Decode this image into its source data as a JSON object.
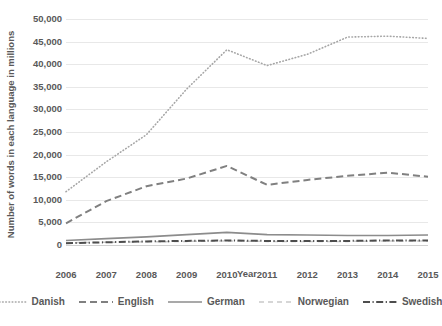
{
  "chart_data": {
    "type": "line",
    "title": "",
    "xlabel": "Year",
    "ylabel": "Number of words in each language in millions",
    "x": [
      2006,
      2007,
      2008,
      2009,
      2010,
      2011,
      2012,
      2013,
      2014,
      2015
    ],
    "xticklabels": [
      "2006",
      "2007",
      "2008",
      "2009",
      "2010",
      "2011",
      "2012",
      "2013",
      "2014",
      "2015"
    ],
    "yticklabels": [
      "0",
      "5,000",
      "10,000",
      "15,000",
      "20,000",
      "25,000",
      "30,000",
      "35,000",
      "40,000",
      "45,000",
      "50,000"
    ],
    "ytickvalues": [
      0,
      5000,
      10000,
      15000,
      20000,
      25000,
      30000,
      35000,
      40000,
      45000,
      50000
    ],
    "ylim": [
      0,
      50000
    ],
    "grid": true,
    "legend_position": "bottom",
    "series": [
      {
        "name": "Danish",
        "style": "dotted",
        "color": "#a6a6a6",
        "values": [
          11800,
          18400,
          24400,
          34500,
          43200,
          39700,
          42200,
          46000,
          46200,
          45700
        ]
      },
      {
        "name": "English",
        "style": "dashed",
        "color": "#808080",
        "values": [
          4800,
          9700,
          13000,
          14700,
          17500,
          13300,
          14400,
          15300,
          16000,
          15100
        ]
      },
      {
        "name": "German",
        "style": "solid",
        "color": "#8c8c8c",
        "values": [
          1000,
          1400,
          1800,
          2300,
          2800,
          2300,
          2200,
          2100,
          2100,
          2200
        ]
      },
      {
        "name": "Norwegian",
        "style": "dashed-light",
        "color": "#c9c9c9",
        "values": [
          500,
          600,
          700,
          800,
          900,
          800,
          800,
          800,
          900,
          900
        ]
      },
      {
        "name": "Swedish",
        "style": "dash-dot",
        "color": "#4d4d4d",
        "values": [
          400,
          600,
          800,
          900,
          1000,
          900,
          900,
          900,
          1000,
          1000
        ]
      }
    ]
  },
  "legend": {
    "items": [
      {
        "label": "Danish"
      },
      {
        "label": "English"
      },
      {
        "label": "German"
      },
      {
        "label": "Norwegian"
      },
      {
        "label": "Swedish"
      }
    ]
  }
}
